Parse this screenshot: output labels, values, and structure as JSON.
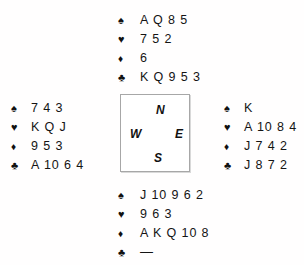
{
  "diagram": {
    "type": "bridge-deal",
    "suit_symbols": {
      "spade": "♠",
      "heart": "♥",
      "diamond": "♦",
      "club": "♣"
    },
    "void_marker": "—",
    "compass": {
      "north": "N",
      "west": "W",
      "east": "E",
      "south": "S"
    },
    "hands": {
      "north": {
        "spades": "A Q 8 5",
        "hearts": "7 5 2",
        "diamonds": "6",
        "clubs": "K Q 9 5 3"
      },
      "west": {
        "spades": "7 4 3",
        "hearts": "K Q J",
        "diamonds": "9 5 3",
        "clubs": "A 10 6 4"
      },
      "east": {
        "spades": "K",
        "hearts": "A 10 8 4",
        "diamonds": "J 7 4 2",
        "clubs": "J 8 7 2"
      },
      "south": {
        "spades": "J 10 9 6 2",
        "hearts": "9 6 3",
        "diamonds": "A K Q 10 8",
        "clubs": "—"
      }
    }
  }
}
